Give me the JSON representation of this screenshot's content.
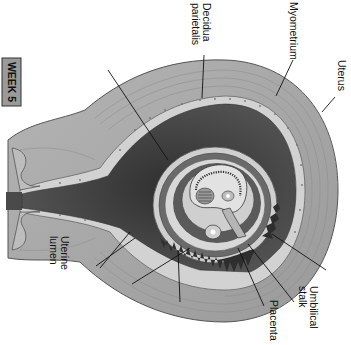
{
  "badge": {
    "label": "WEEK 5"
  },
  "labels": {
    "decidua_parietalis_line1": "Decidua",
    "decidua_parietalis_line2": "parietalis",
    "myometrium": "Myometrium",
    "uterus": "Uterus",
    "umbilical_stalk_line1": "Umbilical",
    "umbilical_stalk_line2": "stalk",
    "placenta": "Placenta",
    "uterine_lumen_line1": "Uterine",
    "uterine_lumen_line2": "lumen"
  },
  "colors": {
    "myometrium": "#a8a8a8",
    "myometrium_outer": "#8e8e8e",
    "decidua": "#d6d6d6",
    "lumen": "#3e3e3e",
    "chorion": "#6a6a6a",
    "villi": "#2e2e2e",
    "background": "#ffffff"
  },
  "orientation": "rotated 90 degrees clockwise"
}
